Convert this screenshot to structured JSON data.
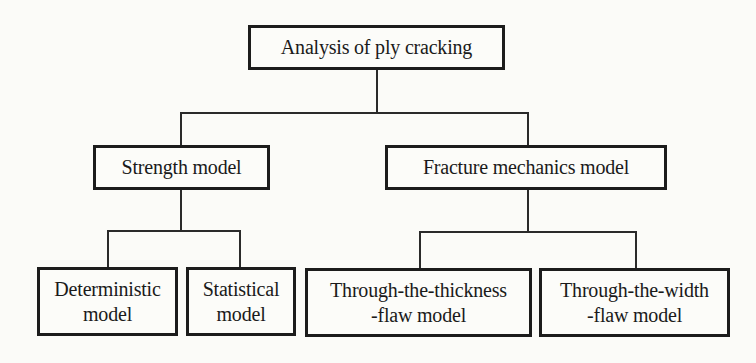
{
  "diagram": {
    "type": "tree",
    "root": {
      "label": "Analysis of ply cracking"
    },
    "level1": [
      {
        "label": "Strength model",
        "children": [
          {
            "line1": "Deterministic",
            "line2": "model"
          },
          {
            "line1": "Statistical",
            "line2": "model"
          }
        ]
      },
      {
        "label": "Fracture mechanics model",
        "children": [
          {
            "line1": "Through-the-thickness",
            "line2": "-flaw model"
          },
          {
            "line1": "Through-the-width",
            "line2": "-flaw model"
          }
        ]
      }
    ],
    "colors": {
      "background": "#fbfbf8",
      "border": "#1c1c1c",
      "text": "#1a1a1a",
      "connector": "#2a2a2a"
    }
  }
}
